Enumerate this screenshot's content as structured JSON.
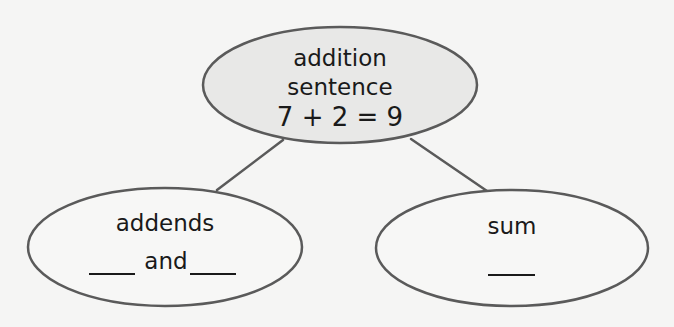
{
  "diagram": {
    "type": "concept-map",
    "colors": {
      "stroke": "#5a5a5a",
      "top_fill": "#e8e8e7",
      "bottom_fill": "#f7f7f6",
      "background": "#f5f5f4",
      "text": "#1a1a1a"
    },
    "nodes": {
      "top": {
        "line1": "addition",
        "line2": "sentence",
        "equation": "7 + 2 = 9"
      },
      "left": {
        "title": "addends",
        "blank_left": "____",
        "connector": "and",
        "blank_right": "____"
      },
      "right": {
        "title": "sum",
        "blank": "____"
      }
    },
    "edges": [
      {
        "from": "addition sentence",
        "to": "addends"
      },
      {
        "from": "addition sentence",
        "to": "sum"
      }
    ]
  }
}
